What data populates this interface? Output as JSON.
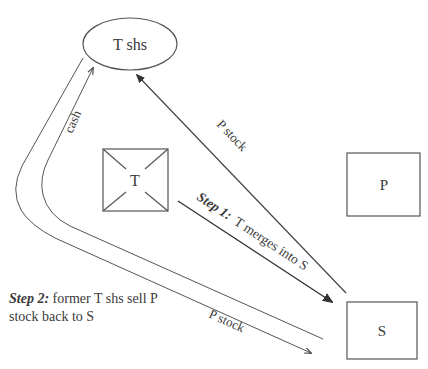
{
  "nodes": {
    "t_shareholders": {
      "label": "T shs",
      "shape": "ellipse"
    },
    "target": {
      "label": "T",
      "shape": "crossed-box"
    },
    "parent": {
      "label": "P",
      "shape": "box"
    },
    "subsidiary": {
      "label": "S",
      "shape": "box"
    }
  },
  "edges": {
    "p_stock_to_t_shs": {
      "label": "P stock",
      "from": "S",
      "to": "T shs"
    },
    "step1_merge": {
      "step": "Step 1:",
      "label": "T merges into S",
      "from": "T",
      "to": "S"
    },
    "cash_to_t_shs": {
      "label": "cash",
      "from": "S",
      "to": "T shs"
    },
    "p_stock_back_to_s": {
      "label": "P stock",
      "from": "T shs",
      "to": "S"
    }
  },
  "caption": {
    "step": "Step 2:",
    "text": " former T shs sell P stock back to S"
  },
  "colors": {
    "stroke": "#4a4a4a",
    "text": "#3a3a3a",
    "background": "#ffffff"
  }
}
